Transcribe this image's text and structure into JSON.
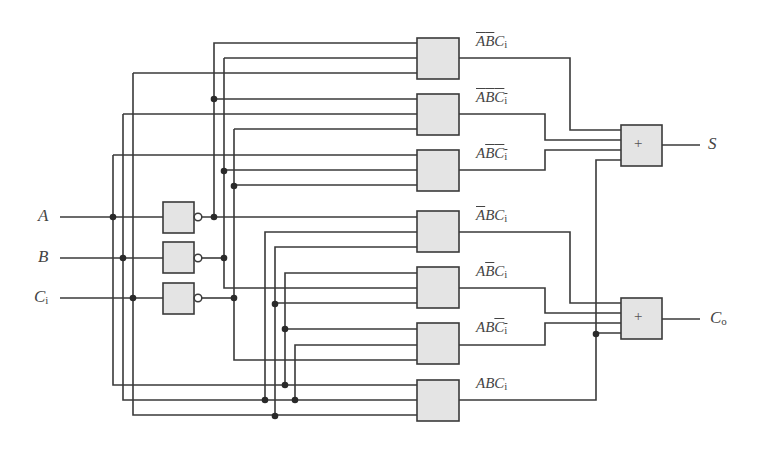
{
  "diagram": {
    "inputs": [
      {
        "name": "A",
        "label": "A",
        "sub": ""
      },
      {
        "name": "B",
        "label": "B",
        "sub": ""
      },
      {
        "name": "Ci",
        "label": "C",
        "sub": "i"
      }
    ],
    "inverters": [
      {
        "input": "A",
        "output": "A-bar"
      },
      {
        "input": "B",
        "output": "B-bar"
      },
      {
        "input": "Ci",
        "output": "Ci-bar"
      }
    ],
    "and_gates": [
      {
        "term": "A'B'Ci",
        "parts": [
          {
            "t": "A",
            "bar": true
          },
          {
            "t": "B",
            "bar": true
          },
          {
            "t": "C",
            "bar": false,
            "sub": "i"
          }
        ]
      },
      {
        "term": "A'B'Ci'",
        "parts": [
          {
            "t": "A",
            "bar": true
          },
          {
            "t": "B",
            "bar": true
          },
          {
            "t": "C",
            "bar": true,
            "sub": "i"
          }
        ]
      },
      {
        "term": "AB'Ci'",
        "parts": [
          {
            "t": "A",
            "bar": false
          },
          {
            "t": "B",
            "bar": true
          },
          {
            "t": "C",
            "bar": true,
            "sub": "i"
          }
        ]
      },
      {
        "term": "A'BCi",
        "parts": [
          {
            "t": "A",
            "bar": true
          },
          {
            "t": "B",
            "bar": false
          },
          {
            "t": "C",
            "bar": false,
            "sub": "i"
          }
        ]
      },
      {
        "term": "AB'Ci",
        "parts": [
          {
            "t": "A",
            "bar": false
          },
          {
            "t": "B",
            "bar": true
          },
          {
            "t": "C",
            "bar": false,
            "sub": "i"
          }
        ]
      },
      {
        "term": "ABCi'",
        "parts": [
          {
            "t": "A",
            "bar": false
          },
          {
            "t": "B",
            "bar": false
          },
          {
            "t": "C",
            "bar": true,
            "sub": "i"
          }
        ]
      },
      {
        "term": "ABCi",
        "parts": [
          {
            "t": "A",
            "bar": false
          },
          {
            "t": "B",
            "bar": false
          },
          {
            "t": "C",
            "bar": false,
            "sub": "i"
          }
        ]
      }
    ],
    "or_gates": [
      {
        "symbol": "+",
        "output_label": "S",
        "output_sub": ""
      },
      {
        "symbol": "+",
        "output_label": "C",
        "output_sub": "o"
      }
    ],
    "colors": {
      "wire": "#3a3a3a",
      "gate_fill": "#e4e4e4",
      "gate_stroke": "#3a3a3a",
      "junction": "#2a2a2a",
      "label": "#444444"
    }
  }
}
